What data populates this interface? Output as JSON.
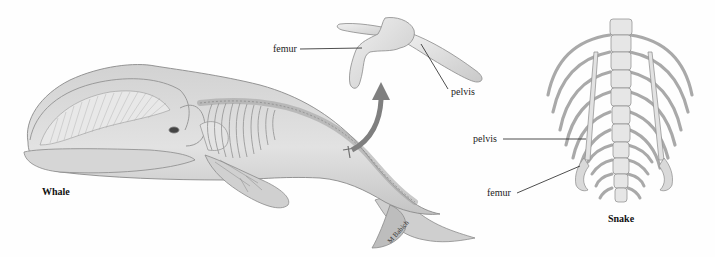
{
  "figure": {
    "panels": [
      {
        "id": "whale",
        "caption": "Whale",
        "labels": []
      },
      {
        "id": "whale-pelvis-detail",
        "labels": [
          {
            "text": "femur"
          },
          {
            "text": "pelvis"
          }
        ]
      },
      {
        "id": "snake",
        "caption": "Snake",
        "labels": [
          {
            "text": "pelvis"
          },
          {
            "text": "femur"
          }
        ]
      }
    ],
    "signature": "M Babich",
    "colors": {
      "background": "#fefefe",
      "body_fill": "#d9d9d9",
      "body_shade": "#bdbdbd",
      "outline": "#8a8a8a",
      "bone_fill": "#e6e6e6",
      "arrow": "#7f7f7f",
      "leader_line": "#222222"
    }
  }
}
